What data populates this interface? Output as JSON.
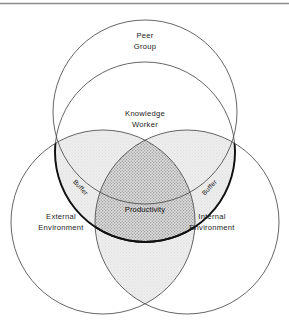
{
  "figure": {
    "type": "venn-diagram",
    "top_rule": true,
    "background_color": "#ffffff",
    "stroke_color": "#3a3a3a",
    "labels": {
      "peer_group_line1": "Peer",
      "peer_group_line2": "Group",
      "knowledge_worker_line1": "Knowledge",
      "knowledge_worker_line2": "Worker",
      "external_environment_line1": "External",
      "external_environment_line2": "Environment",
      "internal_environment_line1": "Internal",
      "internal_environment_line2": "Environment",
      "productivity": "Productivity",
      "buffer_left": "Buffer",
      "buffer_right": "Buffer"
    },
    "circles": [
      {
        "name": "peer-group-outer-circle",
        "cx": 145,
        "cy": 112,
        "r": 92,
        "fill": "none"
      },
      {
        "name": "knowledge-worker-circle",
        "cx": 145,
        "cy": 152,
        "r": 90,
        "fill": "none"
      },
      {
        "name": "external-environment-circle",
        "cx": 103,
        "cy": 222,
        "r": 92,
        "fill": "none"
      },
      {
        "name": "internal-environment-circle",
        "cx": 187,
        "cy": 222,
        "r": 92,
        "fill": "none"
      }
    ],
    "regions": [
      {
        "name": "buffer-band-left",
        "texture": "stipple",
        "fill": "#f2f2f2"
      },
      {
        "name": "buffer-band-right",
        "texture": "stipple",
        "fill": "#f2f2f2"
      },
      {
        "name": "knowledge-external-lens",
        "texture": "light-grid",
        "fill": "#ececec"
      },
      {
        "name": "knowledge-internal-lens",
        "texture": "light-grid",
        "fill": "#ececec"
      },
      {
        "name": "external-internal-lens",
        "texture": "light-grid",
        "fill": "#ececec"
      },
      {
        "name": "productivity-core",
        "texture": "dense-stipple",
        "fill": "#d2d2d2"
      }
    ]
  }
}
